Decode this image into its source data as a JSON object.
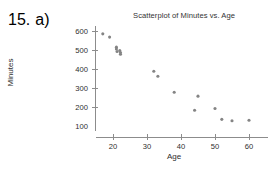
{
  "exercise": {
    "number": "15.",
    "part": "a)"
  },
  "chart_data": {
    "type": "scatter",
    "title": "Scatterplot of Minutes vs. Age",
    "xlabel": "Age",
    "ylabel": "Minutes",
    "xlim": [
      13,
      63
    ],
    "ylim": [
      75,
      625
    ],
    "xticks": [
      20,
      30,
      40,
      50,
      60
    ],
    "xtick_labels": [
      "20",
      "30",
      "40",
      "50",
      "60"
    ],
    "yticks": [
      100,
      200,
      300,
      400,
      500,
      600
    ],
    "ytick_labels": [
      "100",
      "200",
      "300",
      "400",
      "500",
      "600"
    ],
    "grid": false,
    "legend": "none",
    "marker_color": "#848484",
    "marker_size": 3.1,
    "axis_color": "#8c8c8c",
    "points": [
      {
        "x": 17.0,
        "y": 585
      },
      {
        "x": 19.0,
        "y": 568
      },
      {
        "x": 21.0,
        "y": 515
      },
      {
        "x": 21.0,
        "y": 505
      },
      {
        "x": 21.2,
        "y": 492
      },
      {
        "x": 22.0,
        "y": 497
      },
      {
        "x": 22.2,
        "y": 487
      },
      {
        "x": 22.2,
        "y": 478
      },
      {
        "x": 32.0,
        "y": 388
      },
      {
        "x": 33.2,
        "y": 362
      },
      {
        "x": 38.0,
        "y": 278
      },
      {
        "x": 44.0,
        "y": 183
      },
      {
        "x": 45.0,
        "y": 257
      },
      {
        "x": 50.0,
        "y": 192
      },
      {
        "x": 52.0,
        "y": 135
      },
      {
        "x": 55.0,
        "y": 128
      },
      {
        "x": 60.0,
        "y": 130
      }
    ]
  }
}
